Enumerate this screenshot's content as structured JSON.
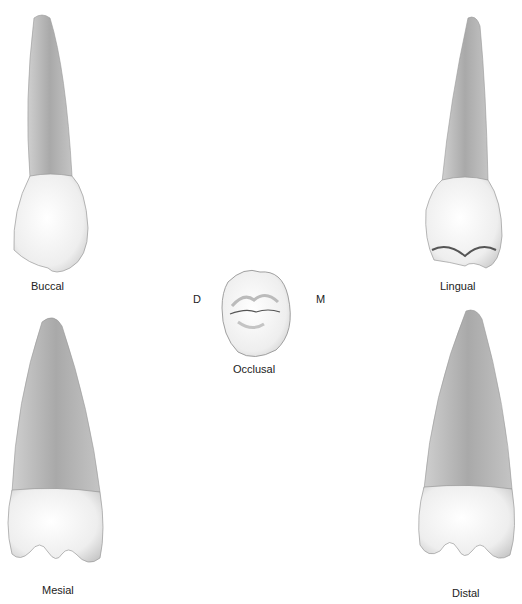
{
  "figure": {
    "views": [
      {
        "id": "buccal",
        "label": "Buccal"
      },
      {
        "id": "lingual",
        "label": "Lingual"
      },
      {
        "id": "occlusal",
        "label": "Occlusal"
      },
      {
        "id": "mesial",
        "label": "Mesial"
      },
      {
        "id": "distal",
        "label": "Distal"
      }
    ],
    "orientation": {
      "left": "D",
      "right": "M"
    },
    "colors": {
      "root": "#b8b8b8",
      "root_dark": "#9a9a9a",
      "crown": "#f2f2f2",
      "crown_shadow": "#cfcfcf",
      "outline": "#8a8a8a",
      "label": "#222222"
    }
  }
}
